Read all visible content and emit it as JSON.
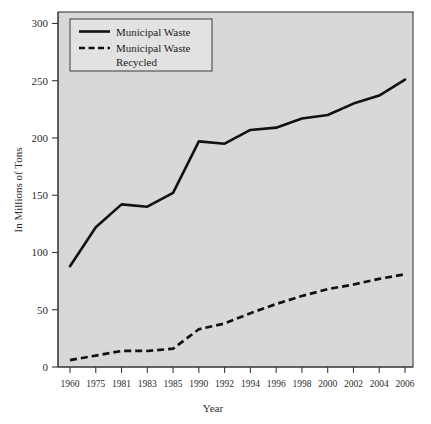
{
  "chart_data": {
    "type": "line",
    "title": "",
    "xlabel": "Year",
    "ylabel": "In Millions of Tons",
    "categories": [
      "1960",
      "1975",
      "1981",
      "1983",
      "1985",
      "1990",
      "1992",
      "1994",
      "1996",
      "1998",
      "2000",
      "2002",
      "2004",
      "2006"
    ],
    "xtick_labels": [
      "1960",
      "1975",
      "1981",
      "1983",
      "1985",
      "1990",
      "1992",
      "1994",
      "1996",
      "1998",
      "2000",
      "2002",
      "2004",
      "2006"
    ],
    "ytick_labels": [
      "0",
      "50",
      "100",
      "150",
      "200",
      "250",
      "300"
    ],
    "ytick_values": [
      0,
      50,
      100,
      150,
      200,
      250,
      300
    ],
    "ylim": [
      0,
      310
    ],
    "grid": false,
    "legend_position": "top-left",
    "series": [
      {
        "name": "Municipal Waste",
        "style": "solid",
        "color": "#111111",
        "values": [
          88,
          122,
          142,
          140,
          152,
          197,
          195,
          207,
          209,
          217,
          220,
          230,
          237,
          251
        ]
      },
      {
        "name": "Municipal Waste Recycled",
        "style": "dashed",
        "color": "#111111",
        "values": [
          6,
          10,
          14,
          14,
          16,
          33,
          38,
          47,
          55,
          62,
          68,
          72,
          77,
          81
        ]
      }
    ]
  },
  "legend": {
    "entries": [
      {
        "label": "Municipal Waste"
      },
      {
        "label_line1": "Municipal Waste",
        "label_line2": "Recycled"
      }
    ]
  },
  "axes": {
    "y_title": "In Millions of Tons",
    "x_title": "Year"
  },
  "colors": {
    "plot_background": "#d8d8d8",
    "page_background": "#ffffff",
    "line": "#111111",
    "axis": "#3a3a3a"
  }
}
